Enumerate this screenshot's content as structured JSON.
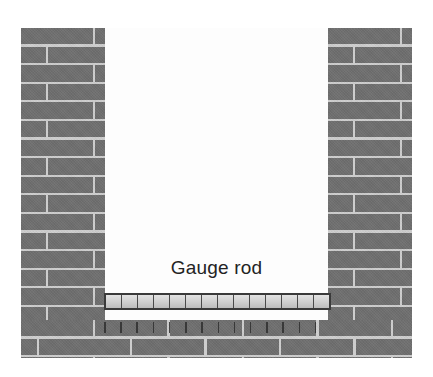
{
  "figure": {
    "background_color": "#ffffff"
  },
  "labels": {
    "gauge_rod": "Gauge rod"
  },
  "colors": {
    "brick_face": "#6e6e6e",
    "mortar": "#cdcdcd",
    "rod_fill": "#d4d4d4",
    "rod_outline": "#3a3a3a",
    "bay_background": "#fdfdfd",
    "text": "#232323"
  },
  "structure": {
    "left_pier": {
      "name": "left brick pier"
    },
    "right_pier": {
      "name": "right brick pier"
    },
    "base_course": {
      "name": "base brick courses"
    },
    "opening": {
      "name": "wall opening"
    }
  },
  "gauge_rod": {
    "segment_count": 14,
    "tick_count": 14
  }
}
